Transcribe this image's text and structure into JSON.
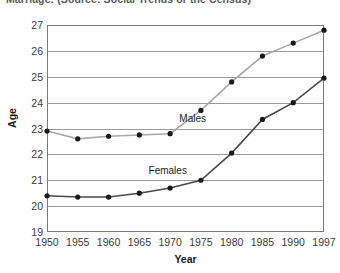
{
  "chart_data": {
    "type": "line",
    "title": "Marriage: (Source: Social Trends or the Census)",
    "xlabel": "Year",
    "ylabel": "Age",
    "categories": [
      "1950",
      "1955",
      "1960",
      "1965",
      "1970",
      "1975",
      "1980",
      "1985",
      "1990",
      "1997"
    ],
    "x_ticks": [
      "1950",
      "1955",
      "1960",
      "1965",
      "1970",
      "1975",
      "1980",
      "1985",
      "1990",
      "1997"
    ],
    "y_ticks": [
      "19",
      "20",
      "21",
      "22",
      "23",
      "24",
      "25",
      "26",
      "27"
    ],
    "ylim": [
      19,
      27
    ],
    "grid": "horizontal",
    "legend_position": "inline-labels",
    "series": [
      {
        "name": "Males",
        "color": "#a8a8a8",
        "marker_color": "#1a1a1a",
        "values": [
          22.9,
          22.6,
          22.7,
          22.75,
          22.8,
          23.7,
          24.8,
          25.8,
          26.3,
          26.8
        ]
      },
      {
        "name": "Females",
        "color": "#4a4a4a",
        "marker_color": "#1a1a1a",
        "values": [
          20.4,
          20.35,
          20.35,
          20.5,
          20.7,
          21.0,
          22.05,
          23.35,
          24.0,
          24.95
        ]
      }
    ],
    "annotations": [
      {
        "text": "Males",
        "x": 1971.5,
        "y": 23.35
      },
      {
        "text": "Females",
        "x": 1966.5,
        "y": 21.35
      }
    ]
  }
}
